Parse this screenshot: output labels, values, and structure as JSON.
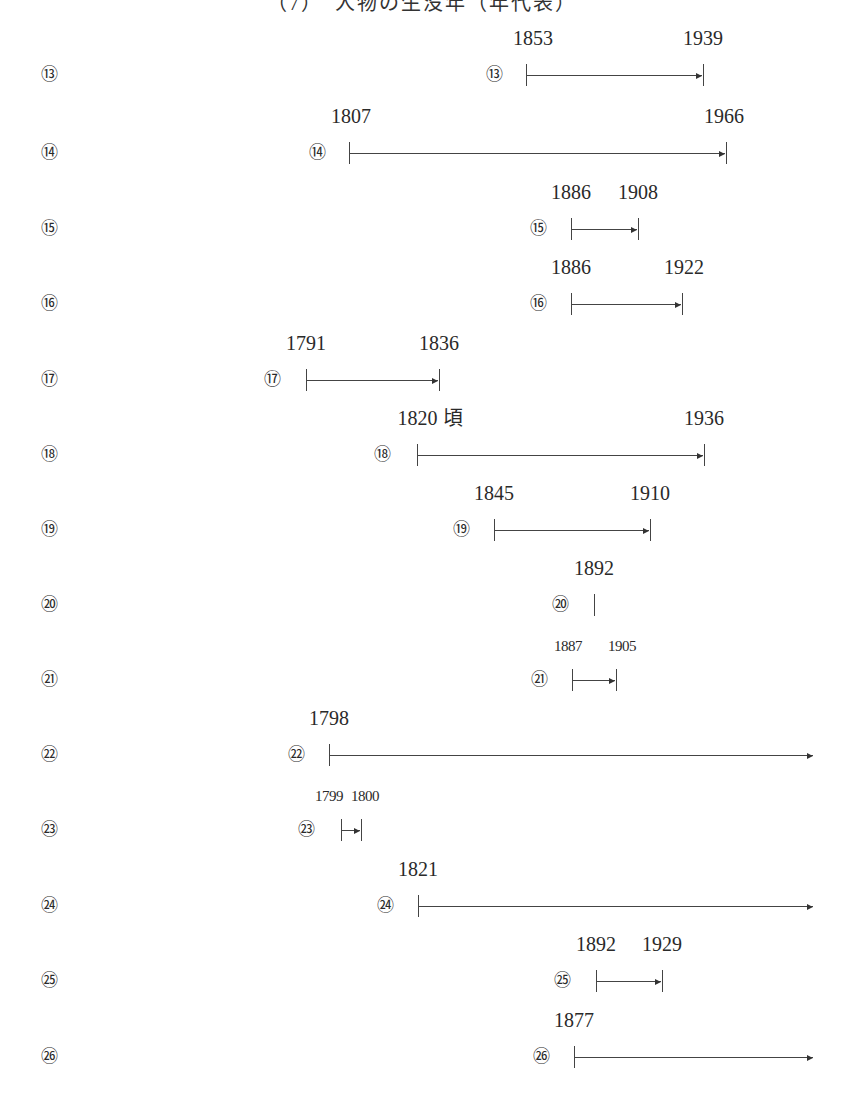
{
  "title_fragment": "（7）　人物の生没年（年代表）",
  "rows": [
    {
      "label": "⑬",
      "start": "1853",
      "end": "1939",
      "y": 75,
      "x1": 526,
      "x2": 703,
      "open": false,
      "marker_x": 494,
      "start_label_x": 533,
      "end_label_x": 703,
      "small": false
    },
    {
      "label": "⑭",
      "start": "1807",
      "end": "1966",
      "y": 153,
      "x1": 349,
      "x2": 726,
      "open": false,
      "marker_x": 317,
      "start_label_x": 351,
      "end_label_x": 724,
      "small": false
    },
    {
      "label": "⑮",
      "start": "1886",
      "end": "1908",
      "y": 229,
      "x1": 571,
      "x2": 638,
      "open": false,
      "marker_x": 538,
      "start_label_x": 571,
      "end_label_x": 638,
      "small": false
    },
    {
      "label": "⑯",
      "start": "1886",
      "end": "1922",
      "y": 304,
      "x1": 571,
      "x2": 682,
      "open": false,
      "marker_x": 538,
      "start_label_x": 571,
      "end_label_x": 684,
      "small": false
    },
    {
      "label": "⑰",
      "start": "1791",
      "end": "1836",
      "y": 380,
      "x1": 306,
      "x2": 439,
      "open": false,
      "marker_x": 272,
      "start_label_x": 306,
      "end_label_x": 439,
      "small": false
    },
    {
      "label": "⑱",
      "start": "1820 頃",
      "end": "1936",
      "y": 455,
      "x1": 417,
      "x2": 704,
      "open": false,
      "marker_x": 382,
      "start_label_x": 430,
      "end_label_x": 704,
      "small": false
    },
    {
      "label": "⑲",
      "start": "1845",
      "end": "1910",
      "y": 530,
      "x1": 494,
      "x2": 650,
      "open": false,
      "marker_x": 461,
      "start_label_x": 494,
      "end_label_x": 650,
      "small": false
    },
    {
      "label": "⑳",
      "start": "1892",
      "end": null,
      "y": 605,
      "x1": 594,
      "x2": null,
      "open": false,
      "point": true,
      "marker_x": 560,
      "start_label_x": 594,
      "end_label_x": null,
      "small": false
    },
    {
      "label": "㉑",
      "start": "1887",
      "end": "1905",
      "y": 680,
      "x1": 572,
      "x2": 616,
      "open": false,
      "marker_x": 539,
      "start_label_x": 568,
      "end_label_x": 622,
      "small": true
    },
    {
      "label": "㉒",
      "start": "1798",
      "end": null,
      "y": 755,
      "x1": 329,
      "x2": 814,
      "open": true,
      "marker_x": 296,
      "start_label_x": 329,
      "end_label_x": null,
      "small": false
    },
    {
      "label": "㉓",
      "start": "1799",
      "end": "1800",
      "y": 830,
      "x1": 341,
      "x2": 361,
      "open": false,
      "marker_x": 306,
      "start_label_x": 329,
      "end_label_x": 365,
      "small": true
    },
    {
      "label": "㉔",
      "start": "1821",
      "end": null,
      "y": 906,
      "x1": 418,
      "x2": 814,
      "open": true,
      "marker_x": 385,
      "start_label_x": 418,
      "end_label_x": null,
      "small": false
    },
    {
      "label": "㉕",
      "start": "1892",
      "end": "1929",
      "y": 981,
      "x1": 596,
      "x2": 662,
      "open": false,
      "marker_x": 562,
      "start_label_x": 596,
      "end_label_x": 662,
      "small": false
    },
    {
      "label": "㉖",
      "start": "1877",
      "end": null,
      "y": 1057,
      "x1": 574,
      "x2": 814,
      "open": true,
      "marker_x": 541,
      "start_label_x": 574,
      "end_label_x": null,
      "small": false
    }
  ]
}
